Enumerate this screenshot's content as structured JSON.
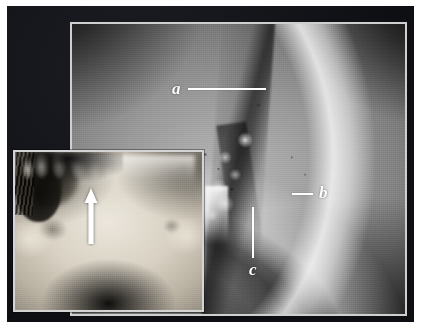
{
  "figure": {
    "background_color": "#0e1014",
    "paper_color": "#ffffff",
    "frame_color": "#cfcfcf"
  },
  "panels": {
    "radiograph": {
      "name": "lateral-radiograph",
      "description": "Lateral skull radiograph showing cranial vault and midfacial region"
    },
    "inset": {
      "name": "skull-photograph-inset",
      "description": "Anterior view photograph of dry skull showing piriform (nasal) aperture",
      "arrow": {
        "icon": "up-arrow-icon",
        "color": "#ffffff",
        "direction": "up"
      }
    }
  },
  "annotations": [
    {
      "id": "a",
      "label": "a",
      "leader": "horizontal-right",
      "color": "#ffffff"
    },
    {
      "id": "b",
      "label": "b",
      "leader": "horizontal-left",
      "color": "#ffffff"
    },
    {
      "id": "c",
      "label": "c",
      "leader": "vertical-up",
      "color": "#ffffff"
    }
  ]
}
